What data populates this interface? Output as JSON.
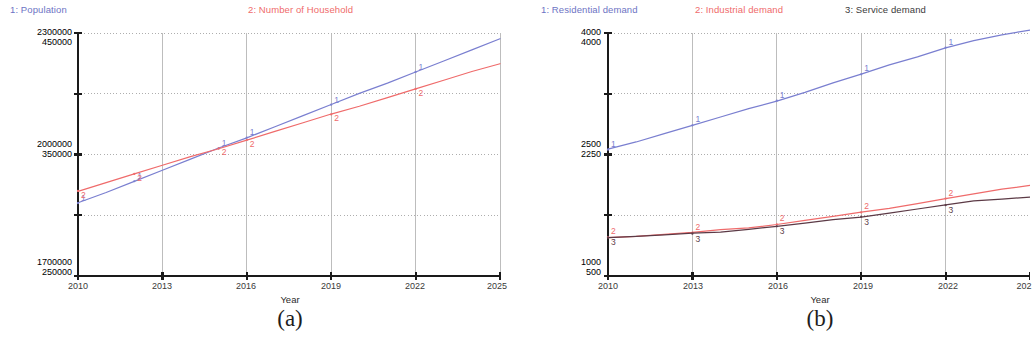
{
  "figure": {
    "captions": {
      "a": "(a)",
      "b": "(b)"
    }
  },
  "colors": {
    "series1": "#7a7fd0",
    "series2": "#ef6b6b",
    "series3": "#5c3a46",
    "series1_text": "#6d73c4",
    "series2_text": "#ef6b6b",
    "series3_text": "#3b3b3b",
    "axis": "#1a1a1a",
    "grid": "#9a9a9a",
    "background": "#ffffff"
  },
  "panel_a": {
    "legend": [
      {
        "label": "1: Population",
        "color": "#6d73c4"
      },
      {
        "label": "2: Number of Household",
        "color": "#ef6b6b"
      }
    ],
    "y_axis_labels": [
      {
        "top": "2300000",
        "bottom": "450000"
      },
      {
        "top": "2000000",
        "bottom": "350000"
      },
      {
        "top": "1700000",
        "bottom": "250000"
      }
    ],
    "x_ticks": [
      "2010",
      "2013",
      "2016",
      "2019",
      "2022",
      "2025"
    ],
    "x_title": "Year"
  },
  "panel_b": {
    "legend": [
      {
        "label": "1: Residential demand",
        "color": "#6d73c4"
      },
      {
        "label": "2: Industrial demand",
        "color": "#ef6b6b"
      },
      {
        "label": "3: Service demand",
        "color": "#3b3b3b"
      }
    ],
    "y_axis_labels": [
      {
        "top": "4000",
        "bottom": "4000"
      },
      {
        "top": "2500",
        "bottom": "2250"
      },
      {
        "top": "1000",
        "bottom": "500"
      }
    ],
    "x_ticks": [
      "2010",
      "2013",
      "2016",
      "2019",
      "2022",
      "202"
    ],
    "x_title": "Year"
  },
  "chart_data": [
    {
      "type": "line",
      "panel": "(a)",
      "title": "",
      "xlabel": "Year",
      "ylabel": "",
      "xlim": [
        2010,
        2025
      ],
      "x": [
        2010,
        2011,
        2012,
        2013,
        2014,
        2015,
        2016,
        2017,
        2018,
        2019,
        2020,
        2021,
        2022,
        2023,
        2024,
        2025
      ],
      "grid": true,
      "legend_position": "top",
      "y_axes": [
        {
          "name": "Population",
          "axis": "left-1",
          "range": [
            1700000,
            2300000
          ],
          "ticks": [
            1700000,
            2000000,
            2300000
          ]
        },
        {
          "name": "Number of Household",
          "axis": "left-2",
          "range": [
            250000,
            450000
          ],
          "ticks": [
            250000,
            350000,
            450000
          ]
        }
      ],
      "series": [
        {
          "name": "Population",
          "id": "1",
          "color": "#7a7fd0",
          "axis": "left-1",
          "values": [
            1880000,
            1907000,
            1934000,
            1961000,
            1988000,
            2015000,
            2042000,
            2069000,
            2096000,
            2123000,
            2150000,
            2177000,
            2204000,
            2231000,
            2258000,
            2285000
          ]
        },
        {
          "name": "Number of Household",
          "id": "2",
          "color": "#ef6b6b",
          "axis": "left-2",
          "values": [
            320000,
            327000,
            334000,
            341000,
            348000,
            355000,
            362000,
            369000,
            376000,
            383000,
            390000,
            397000,
            404000,
            411000,
            418000,
            425000
          ]
        }
      ]
    },
    {
      "type": "line",
      "panel": "(b)",
      "title": "",
      "xlabel": "Year",
      "ylabel": "",
      "xlim": [
        2010,
        2025
      ],
      "x": [
        2010,
        2011,
        2012,
        2013,
        2014,
        2015,
        2016,
        2017,
        2018,
        2019,
        2020,
        2021,
        2022,
        2023,
        2024,
        2025
      ],
      "grid": true,
      "legend_position": "top",
      "y_axes": [
        {
          "name": "Residential demand",
          "axis": "left-1",
          "range": [
            1000,
            4000
          ],
          "ticks": [
            1000,
            2500,
            4000
          ]
        },
        {
          "name": "Industrial / Service demand",
          "axis": "left-2",
          "range": [
            500,
            4000
          ],
          "ticks": [
            500,
            2250,
            4000
          ]
        }
      ],
      "series": [
        {
          "name": "Residential demand",
          "id": "1",
          "color": "#7a7fd0",
          "axis": "left-1",
          "values": [
            2560,
            2660,
            2760,
            2860,
            2960,
            3060,
            3165,
            3270,
            3385,
            3490,
            3600,
            3710,
            3820,
            3905,
            3975,
            4030
          ]
        },
        {
          "name": "Industrial demand",
          "id": "2",
          "color": "#ef6b6b",
          "axis": "left-2",
          "values": [
            1060,
            1075,
            1100,
            1125,
            1160,
            1200,
            1245,
            1300,
            1355,
            1415,
            1480,
            1545,
            1615,
            1680,
            1745,
            1810
          ]
        },
        {
          "name": "Service demand",
          "id": "3",
          "color": "#5c3a46",
          "axis": "left-2",
          "values": [
            1055,
            1070,
            1090,
            1110,
            1140,
            1175,
            1215,
            1260,
            1305,
            1355,
            1410,
            1465,
            1520,
            1575,
            1615,
            1640
          ]
        }
      ]
    }
  ]
}
